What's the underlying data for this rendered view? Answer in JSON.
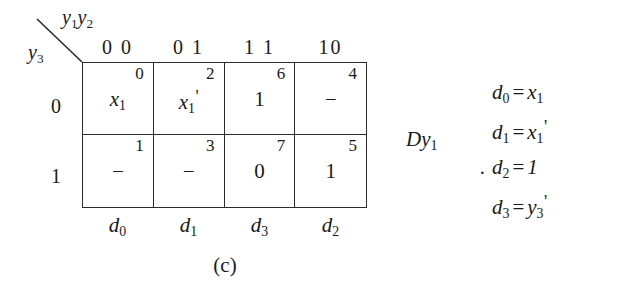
{
  "figure": {
    "caption": "(c)",
    "output_label": "Dy",
    "output_label_sub": "1",
    "equation_bullet": "·"
  },
  "kmap": {
    "column_variables": "y",
    "column_variables_sub1": "1",
    "column_variables_2": "y",
    "column_variables_sub2": "2",
    "row_variable": "y",
    "row_variable_sub": "3",
    "column_headers": [
      "0 0",
      "0 1",
      "1 1",
      "10"
    ],
    "row_headers": [
      "0",
      "1"
    ],
    "footer_labels": [
      {
        "name": "d",
        "sub": "0"
      },
      {
        "name": "d",
        "sub": "1"
      },
      {
        "name": "d",
        "sub": "3"
      },
      {
        "name": "d",
        "sub": "2"
      }
    ],
    "cells": [
      {
        "minterm": "0",
        "value": "x",
        "value_sub": "1",
        "prime": false
      },
      {
        "minterm": "2",
        "value": "x",
        "value_sub": "1",
        "prime": true
      },
      {
        "minterm": "6",
        "value": "1",
        "value_sub": "",
        "prime": false
      },
      {
        "minterm": "4",
        "value": "–",
        "value_sub": "",
        "prime": false
      },
      {
        "minterm": "1",
        "value": "–",
        "value_sub": "",
        "prime": false
      },
      {
        "minterm": "3",
        "value": "–",
        "value_sub": "",
        "prime": false
      },
      {
        "minterm": "7",
        "value": "0",
        "value_sub": "",
        "prime": false
      },
      {
        "minterm": "5",
        "value": "1",
        "value_sub": "",
        "prime": false
      }
    ]
  },
  "equations": [
    {
      "lhs": "d",
      "lhs_sub": "0",
      "op": "=",
      "rhs": "x",
      "rhs_sub": "1",
      "prime": false
    },
    {
      "lhs": "d",
      "lhs_sub": "1",
      "op": "=",
      "rhs": "x",
      "rhs_sub": "1",
      "prime": true
    },
    {
      "lhs": "d",
      "lhs_sub": "2",
      "op": "=",
      "rhs": "1",
      "rhs_sub": "",
      "prime": false
    },
    {
      "lhs": "d",
      "lhs_sub": "3",
      "op": "=",
      "rhs": "y",
      "rhs_sub": "3",
      "prime": true
    }
  ],
  "colors": {
    "ink": "#1a1a1a",
    "rule": "#2b2b2b",
    "background": "#ffffff"
  }
}
